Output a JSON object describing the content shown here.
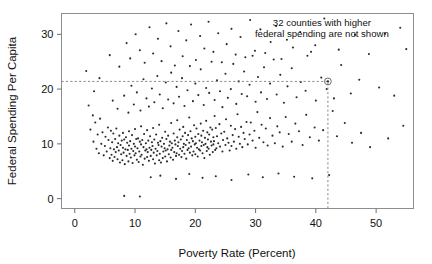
{
  "chart_data": {
    "type": "scatter",
    "title": "",
    "xlabel": "Poverty Rate (Percent)",
    "ylabel": "Federal Spending Per Capita",
    "xlim": [
      -2.2,
      56.2
    ],
    "ylim": [
      -1.8,
      33.8
    ],
    "xticks": [
      0,
      10,
      20,
      30,
      40,
      50
    ],
    "xticklabels": [
      "0",
      "10",
      "20",
      "30",
      "40",
      "50"
    ],
    "yticks": [
      0,
      10,
      20,
      30
    ],
    "yticklabels": [
      "0",
      "10",
      "20",
      "30"
    ],
    "grid": false,
    "legend": null,
    "marker": "dot",
    "marker_color": "#2b2b2b",
    "frame_color": "#8d8d8d",
    "annotations": [
      {
        "name": "excluded-counties-note",
        "lines": [
          "32 counties with higher",
          "federal spending are not shown"
        ],
        "x": 41.0,
        "y": 31.5,
        "align": "center"
      }
    ],
    "reference_lines": [
      {
        "name": "spending-reference",
        "orient": "horizontal",
        "value": 21.4,
        "style": "dashed",
        "x_from": -2.2,
        "x_to": 42.0
      },
      {
        "name": "poverty-reference",
        "orient": "vertical",
        "value": 42.0,
        "style": "dashed",
        "y_from": -1.8,
        "y_to": 21.4
      }
    ],
    "highlighted_point": {
      "name": "reference-county",
      "x": 42.0,
      "y": 21.4,
      "ring": true
    },
    "points": [
      [
        1.9,
        23.3
      ],
      [
        2.3,
        17.0
      ],
      [
        2.6,
        12.6
      ],
      [
        3.0,
        15.2
      ],
      [
        3.1,
        10.4
      ],
      [
        3.4,
        13.9
      ],
      [
        3.6,
        9.1
      ],
      [
        3.8,
        11.7
      ],
      [
        4.0,
        8.3
      ],
      [
        4.2,
        14.6
      ],
      [
        4.4,
        10.0
      ],
      [
        4.6,
        12.1
      ],
      [
        4.8,
        7.9
      ],
      [
        5.0,
        9.6
      ],
      [
        5.1,
        11.3
      ],
      [
        5.3,
        8.6
      ],
      [
        5.5,
        13.0
      ],
      [
        5.6,
        10.7
      ],
      [
        5.8,
        7.4
      ],
      [
        5.9,
        9.2
      ],
      [
        6.0,
        12.4
      ],
      [
        6.1,
        8.0
      ],
      [
        6.2,
        10.3
      ],
      [
        6.3,
        6.9
      ],
      [
        6.4,
        11.9
      ],
      [
        6.5,
        9.0
      ],
      [
        6.6,
        7.6
      ],
      [
        6.7,
        10.9
      ],
      [
        6.8,
        8.5
      ],
      [
        6.9,
        12.8
      ],
      [
        7.0,
        9.4
      ],
      [
        7.1,
        7.2
      ],
      [
        7.2,
        10.1
      ],
      [
        7.3,
        8.8
      ],
      [
        7.4,
        11.5
      ],
      [
        7.5,
        6.6
      ],
      [
        7.6,
        9.8
      ],
      [
        7.7,
        8.1
      ],
      [
        7.8,
        10.6
      ],
      [
        7.9,
        7.0
      ],
      [
        8.0,
        9.3
      ],
      [
        8.0,
        12.0
      ],
      [
        8.1,
        8.4
      ],
      [
        8.2,
        10.8
      ],
      [
        8.3,
        6.3
      ],
      [
        8.4,
        9.0
      ],
      [
        8.5,
        11.2
      ],
      [
        8.6,
        7.8
      ],
      [
        8.7,
        10.2
      ],
      [
        8.8,
        8.9
      ],
      [
        8.9,
        6.8
      ],
      [
        9.0,
        9.7
      ],
      [
        9.0,
        12.3
      ],
      [
        9.1,
        8.2
      ],
      [
        9.2,
        10.5
      ],
      [
        9.3,
        7.5
      ],
      [
        9.4,
        9.1
      ],
      [
        9.5,
        11.6
      ],
      [
        9.6,
        6.5
      ],
      [
        9.7,
        8.7
      ],
      [
        9.8,
        10.0
      ],
      [
        9.9,
        7.9
      ],
      [
        10.0,
        9.5
      ],
      [
        10.0,
        12.7
      ],
      [
        10.1,
        8.3
      ],
      [
        10.2,
        10.9
      ],
      [
        10.3,
        7.1
      ],
      [
        10.4,
        9.2
      ],
      [
        10.5,
        11.0
      ],
      [
        10.6,
        6.7
      ],
      [
        10.7,
        8.6
      ],
      [
        10.8,
        10.4
      ],
      [
        10.9,
        7.7
      ],
      [
        11.0,
        9.9
      ],
      [
        11.0,
        13.2
      ],
      [
        11.1,
        8.0
      ],
      [
        11.2,
        10.7
      ],
      [
        11.3,
        6.2
      ],
      [
        11.4,
        9.4
      ],
      [
        11.5,
        11.8
      ],
      [
        11.6,
        7.3
      ],
      [
        11.7,
        8.8
      ],
      [
        11.8,
        10.1
      ],
      [
        11.9,
        9.0
      ],
      [
        12.0,
        7.6
      ],
      [
        12.0,
        12.5
      ],
      [
        12.1,
        8.5
      ],
      [
        12.2,
        10.6
      ],
      [
        12.3,
        6.9
      ],
      [
        12.4,
        9.3
      ],
      [
        12.5,
        11.4
      ],
      [
        12.6,
        7.8
      ],
      [
        12.7,
        8.9
      ],
      [
        12.8,
        10.3
      ],
      [
        12.9,
        9.6
      ],
      [
        13.0,
        7.2
      ],
      [
        13.0,
        12.9
      ],
      [
        13.1,
        8.4
      ],
      [
        13.2,
        10.8
      ],
      [
        13.3,
        6.4
      ],
      [
        13.4,
        9.1
      ],
      [
        13.5,
        11.7
      ],
      [
        13.6,
        7.9
      ],
      [
        13.7,
        8.7
      ],
      [
        13.8,
        10.2
      ],
      [
        13.9,
        9.8
      ],
      [
        14.0,
        7.0
      ],
      [
        14.0,
        13.5
      ],
      [
        14.1,
        8.2
      ],
      [
        14.2,
        10.5
      ],
      [
        14.3,
        6.6
      ],
      [
        14.4,
        9.5
      ],
      [
        14.5,
        11.1
      ],
      [
        14.6,
        7.4
      ],
      [
        14.7,
        8.6
      ],
      [
        14.8,
        10.0
      ],
      [
        14.9,
        9.2
      ],
      [
        15.0,
        7.7
      ],
      [
        15.0,
        12.2
      ],
      [
        15.1,
        8.8
      ],
      [
        15.2,
        10.9
      ],
      [
        15.3,
        6.8
      ],
      [
        15.4,
        9.0
      ],
      [
        15.5,
        11.5
      ],
      [
        15.6,
        8.1
      ],
      [
        15.7,
        9.7
      ],
      [
        15.8,
        10.4
      ],
      [
        15.9,
        7.5
      ],
      [
        16.0,
        8.9
      ],
      [
        16.0,
        13.8
      ],
      [
        16.1,
        10.1
      ],
      [
        16.2,
        9.3
      ],
      [
        16.3,
        7.1
      ],
      [
        16.4,
        11.9
      ],
      [
        16.5,
        8.5
      ],
      [
        16.6,
        10.6
      ],
      [
        16.7,
        9.9
      ],
      [
        16.8,
        7.8
      ],
      [
        16.9,
        8.3
      ],
      [
        17.0,
        11.2
      ],
      [
        17.0,
        14.3
      ],
      [
        17.1,
        9.6
      ],
      [
        17.2,
        10.3
      ],
      [
        17.3,
        8.0
      ],
      [
        17.4,
        12.6
      ],
      [
        17.5,
        9.1
      ],
      [
        17.6,
        10.8
      ],
      [
        17.7,
        7.6
      ],
      [
        17.8,
        8.7
      ],
      [
        17.9,
        11.4
      ],
      [
        18.0,
        9.4
      ],
      [
        18.0,
        13.1
      ],
      [
        18.1,
        10.0
      ],
      [
        18.2,
        8.2
      ],
      [
        18.3,
        12.0
      ],
      [
        18.4,
        9.8
      ],
      [
        18.5,
        7.3
      ],
      [
        18.6,
        10.7
      ],
      [
        18.7,
        8.9
      ],
      [
        18.8,
        11.6
      ],
      [
        18.9,
        9.2
      ],
      [
        19.0,
        10.2
      ],
      [
        19.0,
        14.8
      ],
      [
        19.1,
        8.4
      ],
      [
        19.2,
        12.3
      ],
      [
        19.3,
        9.5
      ],
      [
        19.4,
        11.0
      ],
      [
        19.5,
        7.9
      ],
      [
        19.6,
        10.5
      ],
      [
        19.7,
        8.6
      ],
      [
        19.8,
        13.4
      ],
      [
        19.9,
        9.9
      ],
      [
        20.0,
        11.3
      ],
      [
        20.0,
        8.1
      ],
      [
        20.1,
        10.1
      ],
      [
        20.2,
        12.8
      ],
      [
        20.3,
        9.3
      ],
      [
        20.4,
        7.7
      ],
      [
        20.5,
        11.8
      ],
      [
        20.6,
        9.0
      ],
      [
        20.7,
        10.6
      ],
      [
        20.8,
        8.8
      ],
      [
        20.9,
        13.7
      ],
      [
        21.0,
        9.6
      ],
      [
        21.0,
        11.5
      ],
      [
        21.1,
        10.3
      ],
      [
        21.2,
        8.3
      ],
      [
        21.3,
        12.4
      ],
      [
        21.4,
        9.8
      ],
      [
        21.5,
        7.4
      ],
      [
        21.6,
        11.1
      ],
      [
        21.7,
        10.0
      ],
      [
        21.8,
        14.2
      ],
      [
        21.9,
        8.7
      ],
      [
        22.0,
        9.4
      ],
      [
        22.0,
        12.1
      ],
      [
        22.1,
        10.8
      ],
      [
        22.2,
        9.1
      ],
      [
        22.3,
        11.7
      ],
      [
        22.4,
        8.0
      ],
      [
        22.5,
        13.0
      ],
      [
        22.6,
        10.4
      ],
      [
        22.7,
        9.7
      ],
      [
        22.8,
        12.6
      ],
      [
        22.9,
        8.5
      ],
      [
        23.0,
        11.2
      ],
      [
        23.0,
        9.9
      ],
      [
        23.1,
        10.5
      ],
      [
        23.2,
        15.1
      ],
      [
        23.3,
        8.9
      ],
      [
        23.4,
        12.9
      ],
      [
        23.5,
        9.2
      ],
      [
        23.6,
        11.4
      ],
      [
        23.8,
        10.1
      ],
      [
        24.0,
        13.6
      ],
      [
        24.1,
        9.5
      ],
      [
        24.3,
        11.9
      ],
      [
        24.5,
        8.6
      ],
      [
        24.6,
        10.7
      ],
      [
        24.8,
        12.2
      ],
      [
        25.0,
        9.8
      ],
      [
        25.1,
        14.5
      ],
      [
        25.3,
        11.0
      ],
      [
        25.5,
        10.2
      ],
      [
        25.7,
        8.8
      ],
      [
        25.9,
        13.3
      ],
      [
        26.0,
        9.6
      ],
      [
        26.2,
        11.6
      ],
      [
        26.4,
        10.4
      ],
      [
        26.6,
        12.7
      ],
      [
        26.8,
        9.1
      ],
      [
        27.0,
        15.4
      ],
      [
        27.2,
        11.3
      ],
      [
        27.4,
        10.0
      ],
      [
        27.6,
        13.1
      ],
      [
        27.8,
        9.4
      ],
      [
        28.0,
        12.0
      ],
      [
        28.2,
        10.9
      ],
      [
        28.5,
        14.0
      ],
      [
        28.7,
        9.9
      ],
      [
        29.0,
        11.7
      ],
      [
        29.2,
        13.9
      ],
      [
        29.5,
        10.6
      ],
      [
        29.8,
        12.4
      ],
      [
        30.0,
        9.3
      ],
      [
        30.3,
        15.8
      ],
      [
        30.6,
        11.1
      ],
      [
        31.0,
        13.5
      ],
      [
        31.3,
        10.3
      ],
      [
        31.7,
        12.8
      ],
      [
        32.0,
        9.7
      ],
      [
        32.4,
        14.7
      ],
      [
        32.8,
        11.5
      ],
      [
        33.2,
        10.1
      ],
      [
        33.6,
        13.2
      ],
      [
        34.0,
        12.1
      ],
      [
        34.5,
        9.5
      ],
      [
        35.0,
        14.9
      ],
      [
        35.5,
        11.8
      ],
      [
        36.0,
        10.4
      ],
      [
        36.6,
        13.7
      ],
      [
        37.2,
        12.3
      ],
      [
        37.8,
        9.8
      ],
      [
        38.4,
        15.3
      ],
      [
        39.0,
        11.2
      ],
      [
        39.8,
        13.0
      ],
      [
        40.5,
        10.6
      ],
      [
        41.2,
        12.5
      ],
      [
        42.8,
        16.0
      ],
      [
        43.5,
        11.4
      ],
      [
        44.8,
        13.8
      ],
      [
        46.0,
        10.2
      ],
      [
        47.5,
        12.0
      ],
      [
        49.0,
        9.4
      ],
      [
        52.0,
        11.0
      ],
      [
        54.5,
        13.3
      ],
      [
        6.3,
        17.9
      ],
      [
        7.1,
        16.4
      ],
      [
        8.2,
        18.8
      ],
      [
        8.9,
        15.7
      ],
      [
        9.4,
        20.6
      ],
      [
        9.8,
        17.2
      ],
      [
        10.3,
        19.4
      ],
      [
        10.9,
        16.1
      ],
      [
        11.4,
        21.8
      ],
      [
        11.9,
        18.3
      ],
      [
        12.3,
        16.8
      ],
      [
        12.8,
        20.1
      ],
      [
        13.2,
        17.6
      ],
      [
        13.7,
        22.4
      ],
      [
        14.1,
        19.0
      ],
      [
        14.6,
        16.5
      ],
      [
        15.1,
        21.2
      ],
      [
        15.5,
        18.1
      ],
      [
        16.0,
        23.0
      ],
      [
        16.4,
        17.4
      ],
      [
        16.9,
        20.4
      ],
      [
        17.3,
        18.6
      ],
      [
        17.8,
        22.0
      ],
      [
        18.2,
        16.9
      ],
      [
        18.7,
        19.8
      ],
      [
        19.1,
        24.2
      ],
      [
        19.6,
        17.8
      ],
      [
        20.0,
        21.0
      ],
      [
        20.5,
        18.9
      ],
      [
        20.9,
        23.6
      ],
      [
        21.4,
        17.1
      ],
      [
        21.8,
        20.2
      ],
      [
        22.3,
        19.3
      ],
      [
        22.7,
        25.0
      ],
      [
        23.2,
        18.0
      ],
      [
        23.6,
        21.6
      ],
      [
        24.1,
        19.6
      ],
      [
        24.5,
        16.7
      ],
      [
        25.0,
        22.8
      ],
      [
        25.4,
        18.4
      ],
      [
        25.9,
        20.0
      ],
      [
        26.3,
        24.6
      ],
      [
        26.8,
        17.3
      ],
      [
        27.2,
        21.4
      ],
      [
        27.7,
        19.1
      ],
      [
        28.1,
        23.2
      ],
      [
        28.6,
        18.7
      ],
      [
        29.0,
        20.8
      ],
      [
        29.5,
        26.1
      ],
      [
        30.0,
        17.7
      ],
      [
        30.4,
        22.2
      ],
      [
        30.9,
        19.4
      ],
      [
        31.4,
        24.0
      ],
      [
        31.9,
        18.2
      ],
      [
        32.4,
        21.0
      ],
      [
        33.0,
        25.4
      ],
      [
        33.5,
        19.0
      ],
      [
        34.1,
        22.6
      ],
      [
        34.7,
        17.5
      ],
      [
        35.3,
        20.5
      ],
      [
        36.0,
        23.8
      ],
      [
        36.8,
        18.5
      ],
      [
        37.5,
        21.3
      ],
      [
        38.3,
        19.7
      ],
      [
        39.2,
        26.8
      ],
      [
        40.0,
        17.9
      ],
      [
        40.9,
        22.1
      ],
      [
        41.8,
        20.0
      ],
      [
        43.0,
        18.3
      ],
      [
        44.2,
        24.4
      ],
      [
        45.8,
        19.2
      ],
      [
        47.2,
        21.7
      ],
      [
        50.5,
        20.3
      ],
      [
        53.0,
        18.8
      ],
      [
        55.0,
        27.3
      ],
      [
        5.8,
        26.2
      ],
      [
        7.4,
        24.1
      ],
      [
        8.6,
        28.4
      ],
      [
        9.2,
        25.6
      ],
      [
        10.1,
        30.0
      ],
      [
        10.8,
        27.1
      ],
      [
        11.6,
        24.8
      ],
      [
        12.4,
        31.3
      ],
      [
        13.0,
        26.5
      ],
      [
        13.8,
        29.2
      ],
      [
        14.4,
        25.1
      ],
      [
        15.2,
        32.0
      ],
      [
        15.9,
        27.8
      ],
      [
        16.6,
        24.3
      ],
      [
        17.2,
        30.6
      ],
      [
        17.9,
        26.0
      ],
      [
        18.5,
        28.9
      ],
      [
        19.3,
        31.8
      ],
      [
        20.1,
        25.3
      ],
      [
        20.8,
        29.7
      ],
      [
        21.5,
        27.4
      ],
      [
        22.2,
        32.3
      ],
      [
        23.0,
        26.8
      ],
      [
        23.8,
        30.2
      ],
      [
        24.4,
        24.9
      ],
      [
        25.2,
        28.2
      ],
      [
        26.0,
        31.0
      ],
      [
        26.7,
        26.3
      ],
      [
        27.5,
        29.5
      ],
      [
        28.3,
        25.8
      ],
      [
        29.1,
        32.6
      ],
      [
        29.9,
        27.0
      ],
      [
        30.8,
        30.9
      ],
      [
        31.6,
        26.6
      ],
      [
        32.5,
        28.6
      ],
      [
        33.4,
        31.5
      ],
      [
        34.3,
        25.5
      ],
      [
        35.2,
        29.0
      ],
      [
        36.2,
        27.6
      ],
      [
        37.4,
        30.4
      ],
      [
        38.6,
        26.1
      ],
      [
        39.9,
        28.0
      ],
      [
        41.4,
        32.9
      ],
      [
        43.8,
        27.2
      ],
      [
        46.5,
        29.9
      ],
      [
        48.8,
        26.4
      ],
      [
        51.5,
        30.1
      ],
      [
        54.0,
        31.2
      ],
      [
        8.2,
        0.5
      ],
      [
        10.8,
        0.4
      ],
      [
        3.2,
        19.6
      ],
      [
        4.1,
        22.0
      ],
      [
        12.6,
        3.9
      ],
      [
        14.2,
        4.2
      ],
      [
        16.8,
        3.6
      ],
      [
        19.0,
        4.5
      ],
      [
        21.2,
        3.8
      ],
      [
        23.4,
        4.1
      ],
      [
        26.0,
        3.4
      ],
      [
        28.8,
        4.4
      ],
      [
        31.2,
        3.9
      ],
      [
        33.8,
        4.6
      ],
      [
        36.4,
        4.0
      ],
      [
        39.4,
        3.7
      ],
      [
        42.2,
        4.3
      ]
    ]
  }
}
